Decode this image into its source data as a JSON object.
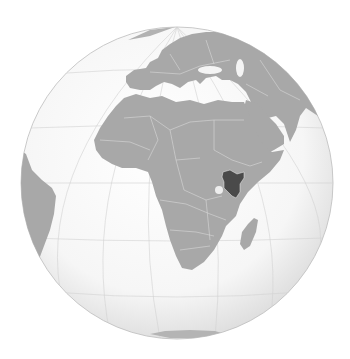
{
  "map": {
    "projection": "orthographic",
    "highlighted_country": "Kenya",
    "region": "Africa",
    "colors": {
      "background": "#ffffff",
      "ocean": "#f7f7f7",
      "ocean_edge": "#dcdcdc",
      "land": "#a8a8a8",
      "highlight": "#4a4a4a",
      "borders": "#d6d6d6",
      "graticule": "#cfcfcf",
      "globe_outline": "#bdbdbd"
    },
    "globe": {
      "cx": 177,
      "cy": 183,
      "r": 156
    }
  }
}
